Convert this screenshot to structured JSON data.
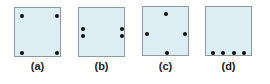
{
  "figure": {
    "panels": [
      {
        "label": "(a)",
        "box": {
          "x": 14,
          "y": 7
        },
        "dots": [
          [
            7,
            8
          ],
          [
            42,
            8
          ],
          [
            7,
            45
          ],
          [
            42,
            45
          ]
        ]
      },
      {
        "label": "(b)",
        "box": {
          "x": 78,
          "y": 7
        },
        "dots": [
          [
            4,
            21
          ],
          [
            4,
            28
          ],
          [
            43,
            21
          ],
          [
            43,
            28
          ]
        ]
      },
      {
        "label": "(c)",
        "box": {
          "x": 142,
          "y": 6
        },
        "dots": [
          [
            23,
            7
          ],
          [
            4,
            27
          ],
          [
            42,
            27
          ],
          [
            24,
            46
          ]
        ]
      },
      {
        "label": "(d)",
        "box": {
          "x": 205,
          "y": 6
        },
        "dots": [
          [
            7,
            46
          ],
          [
            17,
            46
          ],
          [
            28,
            46
          ],
          [
            38,
            46
          ]
        ]
      }
    ],
    "colors": {
      "box_fill": "#dcedf4",
      "box_border": "#8f9a9e",
      "dot": "#111111"
    }
  }
}
